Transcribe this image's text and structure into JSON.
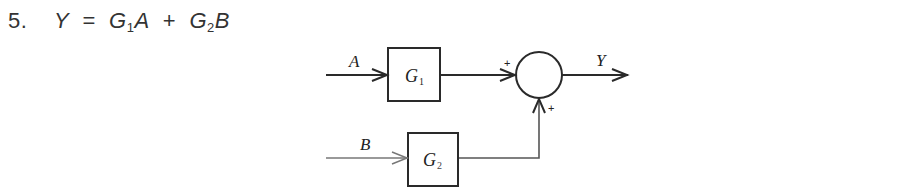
{
  "problem": {
    "number": "5.",
    "equation": {
      "lhs": "Y",
      "equals": "=",
      "term1_gain": "G",
      "term1_sub": "1",
      "term1_input": "A",
      "plus": "+",
      "term2_gain": "G",
      "term2_sub": "2",
      "term2_input": "B"
    }
  },
  "diagram": {
    "input_a": "A",
    "input_b": "B",
    "block1": {
      "label": "G",
      "sub": "1"
    },
    "block2": {
      "label": "G",
      "sub": "2"
    },
    "sum_sign_top": "+",
    "sum_sign_bottom": "+",
    "output": "Y",
    "colors": {
      "stroke": "#2a2a2a",
      "b_line": "#777777"
    }
  }
}
